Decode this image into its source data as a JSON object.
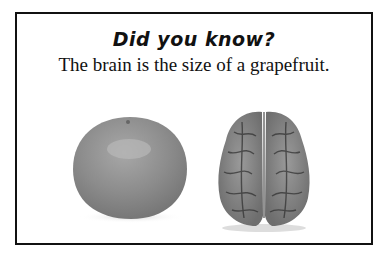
{
  "card": {
    "title": "Did you know?",
    "fact": "The brain is the size of a grapefruit."
  },
  "images": [
    {
      "name": "grapefruit",
      "alt": "grapefruit"
    },
    {
      "name": "brain",
      "alt": "human brain (top view)"
    }
  ]
}
